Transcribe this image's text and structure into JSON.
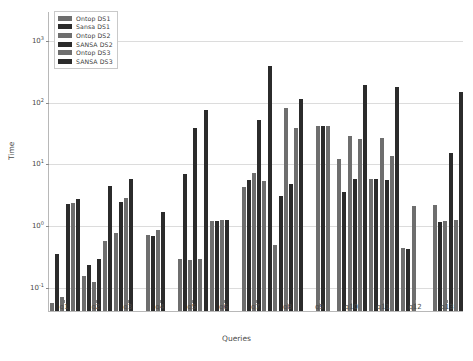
{
  "chart_data": {
    "type": "bar",
    "title": "",
    "xlabel": "Queries",
    "ylabel": "Time",
    "yscale": "log",
    "ylim": [
      0.04,
      3000
    ],
    "grid": true,
    "legend_position": "upper-left",
    "y_ticks": [
      {
        "value": 0.1,
        "label": "10",
        "exponent": "-1"
      },
      {
        "value": 1,
        "label": "10",
        "exponent": "0"
      },
      {
        "value": 10,
        "label": "10",
        "exponent": "1"
      },
      {
        "value": 100,
        "label": "10",
        "exponent": "2"
      },
      {
        "value": 1000,
        "label": "10",
        "exponent": "3"
      }
    ],
    "categories": [
      "q1",
      "q2",
      "q3",
      "q4",
      "q5",
      "q6",
      "q7",
      "q8",
      "q9",
      "q10",
      "q11",
      "q12",
      "q13"
    ],
    "series": [
      {
        "name": "Ontop DS1",
        "color": "#6e6e6e",
        "values": [
          0.055,
          0.15,
          0.75,
          0.68,
          0.28,
          1.15,
          4.2,
          0.48,
          null,
          12.0,
          5.6,
          0.42,
          2.1
        ]
      },
      {
        "name": "Sansa DS1",
        "color": "#2b2b2b",
        "values": [
          0.34,
          0.22,
          2.4,
          0.66,
          6.8,
          1.18,
          5.4,
          3.0,
          null,
          3.4,
          5.5,
          0.41,
          1.1
        ]
      },
      {
        "name": "Ontop DS2",
        "color": "#6e6e6e",
        "values": [
          0.068,
          0.12,
          2.7,
          0.82,
          0.27,
          1.2,
          7.0,
          80.0,
          41.0,
          28.0,
          26.0,
          2.0,
          1.15
        ]
      },
      {
        "name": "SANSA DS2",
        "color": "#2b2b2b",
        "values": [
          2.2,
          0.28,
          5.5,
          1.6,
          37.0,
          1.2,
          50.0,
          4.6,
          41.0,
          5.5,
          5.4,
          null,
          15.0
        ]
      },
      {
        "name": "Ontop DS3",
        "color": "#6e6e6e",
        "values": [
          2.3,
          0.55,
          null,
          null,
          0.28,
          null,
          5.2,
          38.0,
          41.0,
          25.0,
          13.0,
          null,
          1.2
        ]
      },
      {
        "name": "SANSA DS3",
        "color": "#2b2b2b",
        "values": [
          2.6,
          4.3,
          null,
          null,
          75.0,
          null,
          390.0,
          110.0,
          null,
          190.0,
          175.0,
          null,
          145.0
        ]
      }
    ]
  },
  "legend": {
    "entries": [
      {
        "label": "Ontop DS1"
      },
      {
        "label": "Sansa DS1"
      },
      {
        "label": "Ontop DS2"
      },
      {
        "label": "SANSA DS2"
      },
      {
        "label": "Ontop DS3"
      },
      {
        "label": "SANSA DS3"
      }
    ]
  },
  "axes": {
    "x_title": "Queries",
    "y_title": "Time"
  }
}
